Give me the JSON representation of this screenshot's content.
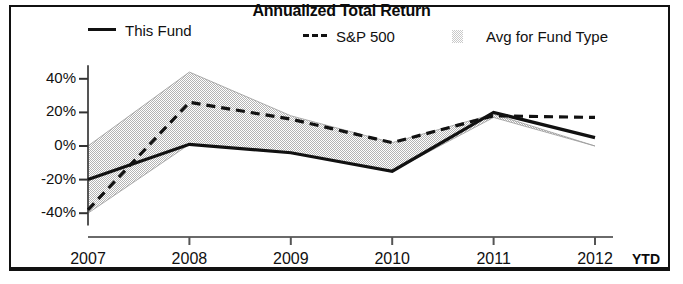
{
  "chart_data": {
    "type": "line",
    "title": "Annualized Total Return",
    "xlabel": "",
    "ylabel": "",
    "x": [
      "2007",
      "2008",
      "2009",
      "2010",
      "2011",
      "2012"
    ],
    "x_suffix_label": "YTD",
    "ytick_labels": [
      "40%",
      "20%",
      "0%",
      "-20%",
      "-40%"
    ],
    "ytick_values": [
      40,
      20,
      0,
      -20,
      -40
    ],
    "ylim": [
      -45,
      48
    ],
    "grid": false,
    "legend_position": "top",
    "series": [
      {
        "name": "This Fund",
        "style": "solid",
        "color": "#111111",
        "marker": "line-solid",
        "values": [
          -20,
          1,
          -4,
          -15,
          20,
          5
        ]
      },
      {
        "name": "S&P 500",
        "style": "dashed",
        "color": "#111111",
        "marker": "line-dashed",
        "values": [
          -38,
          26,
          16,
          2,
          18,
          17
        ]
      },
      {
        "name": "Avg for Fund Type",
        "style": "band",
        "color": "#c9c9c9",
        "marker": "patch",
        "upper": [
          0,
          44,
          18,
          2,
          19,
          0
        ],
        "lower": [
          -40,
          1,
          -4,
          -15,
          17,
          0
        ]
      }
    ]
  },
  "legend": {
    "items": [
      {
        "label": "This Fund"
      },
      {
        "label": "S&P 500"
      },
      {
        "label": "Avg for Fund Type"
      }
    ]
  }
}
